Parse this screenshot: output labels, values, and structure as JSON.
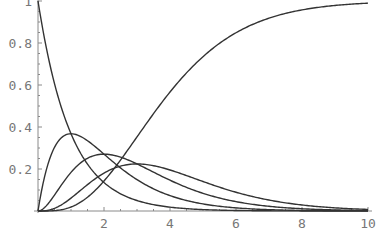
{
  "chart_data": {
    "type": "line",
    "title": "",
    "xlabel": "",
    "ylabel": "",
    "xlim": [
      0,
      10
    ],
    "ylim": [
      0,
      1
    ],
    "grid": false,
    "legend": null,
    "x_ticks": [
      2,
      4,
      6,
      8,
      10
    ],
    "x_tick_labels": [
      "2",
      "4",
      "6",
      "8",
      "10"
    ],
    "y_ticks": [
      0.2,
      0.4,
      0.6,
      0.8,
      1
    ],
    "y_tick_labels": [
      "0.2",
      "0.4",
      "0.6",
      "0.8",
      "1"
    ],
    "x": [
      0,
      0.5,
      1,
      1.5,
      2,
      2.5,
      3,
      3.5,
      4,
      5,
      6,
      7,
      8,
      9,
      10
    ],
    "series": [
      {
        "name": "exp(-t)",
        "values": [
          1.0,
          0.607,
          0.368,
          0.223,
          0.135,
          0.082,
          0.05,
          0.03,
          0.018,
          0.007,
          0.002,
          0.001,
          0.0,
          0.0,
          0.0
        ]
      },
      {
        "name": "t*exp(-t)",
        "values": [
          0.0,
          0.303,
          0.368,
          0.335,
          0.271,
          0.205,
          0.149,
          0.106,
          0.073,
          0.034,
          0.015,
          0.006,
          0.003,
          0.001,
          0.0
        ]
      },
      {
        "name": "t^2/2*exp(-t)",
        "values": [
          0.0,
          0.076,
          0.184,
          0.251,
          0.271,
          0.257,
          0.224,
          0.185,
          0.147,
          0.084,
          0.045,
          0.022,
          0.011,
          0.005,
          0.002
        ]
      },
      {
        "name": "t^3/6*exp(-t)",
        "values": [
          0.0,
          0.013,
          0.061,
          0.126,
          0.18,
          0.214,
          0.224,
          0.216,
          0.195,
          0.14,
          0.089,
          0.052,
          0.029,
          0.015,
          0.008
        ]
      },
      {
        "name": "1 - sum_{k=0..3} t^k/k! exp(-t)",
        "values": [
          0.0,
          0.002,
          0.019,
          0.066,
          0.143,
          0.242,
          0.353,
          0.463,
          0.567,
          0.735,
          0.849,
          0.918,
          0.958,
          0.979,
          0.99
        ]
      }
    ],
    "annotations": []
  },
  "plot": {
    "origin_px": [
      38,
      211
    ],
    "x_px_per_unit": 33,
    "y_px_per_unit": 210,
    "colors": {
      "curve": "#333333",
      "axis": "#8a8a8a",
      "label": "#777777",
      "background": "#ffffff"
    }
  }
}
